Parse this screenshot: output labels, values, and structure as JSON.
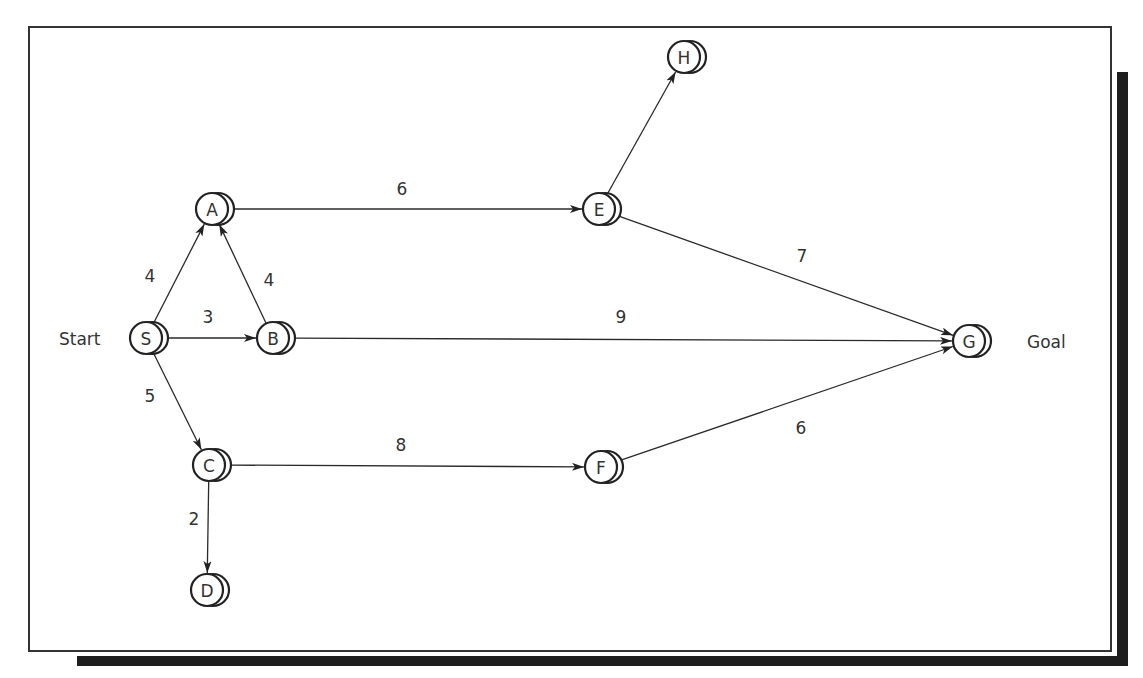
{
  "diagram": {
    "type": "directed-weighted-graph",
    "start_label": "Start",
    "goal_label": "Goal",
    "nodes": [
      {
        "id": "S",
        "label": "S",
        "x": 146,
        "y": 338
      },
      {
        "id": "A",
        "label": "A",
        "x": 212,
        "y": 209
      },
      {
        "id": "B",
        "label": "B",
        "x": 273,
        "y": 338
      },
      {
        "id": "C",
        "label": "C",
        "x": 209,
        "y": 465
      },
      {
        "id": "D",
        "label": "D",
        "x": 207,
        "y": 590
      },
      {
        "id": "E",
        "label": "E",
        "x": 599,
        "y": 209
      },
      {
        "id": "H",
        "label": "H",
        "x": 684,
        "y": 57
      },
      {
        "id": "F",
        "label": "F",
        "x": 601,
        "y": 467
      },
      {
        "id": "G",
        "label": "G",
        "x": 969,
        "y": 341
      }
    ],
    "edges": [
      {
        "from": "S",
        "to": "A",
        "weight": "4",
        "lx": 150,
        "ly": 276
      },
      {
        "from": "S",
        "to": "B",
        "weight": "3",
        "lx": 208,
        "ly": 317
      },
      {
        "from": "S",
        "to": "C",
        "weight": "5",
        "lx": 150,
        "ly": 396
      },
      {
        "from": "B",
        "to": "A",
        "weight": "4",
        "lx": 269,
        "ly": 280
      },
      {
        "from": "A",
        "to": "E",
        "weight": "6",
        "lx": 402,
        "ly": 189
      },
      {
        "from": "E",
        "to": "H",
        "weight": "",
        "lx": 0,
        "ly": 0
      },
      {
        "from": "E",
        "to": "G",
        "weight": "7",
        "lx": 802,
        "ly": 256
      },
      {
        "from": "B",
        "to": "G",
        "weight": "9",
        "lx": 621,
        "ly": 317
      },
      {
        "from": "C",
        "to": "F",
        "weight": "8",
        "lx": 401,
        "ly": 445
      },
      {
        "from": "C",
        "to": "D",
        "weight": "2",
        "lx": 194,
        "ly": 519
      },
      {
        "from": "F",
        "to": "G",
        "weight": "6",
        "lx": 801,
        "ly": 428
      }
    ]
  }
}
